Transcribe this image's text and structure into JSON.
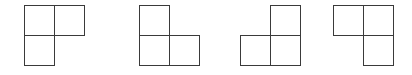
{
  "diagram": {
    "stroke_color": "#3a3a3a",
    "background": "#ffffff",
    "cell_size_px": 30,
    "shapes": [
      {
        "id": "shape-1",
        "missing_cell": "bottom-right",
        "cells": [
          "top-left",
          "top-right",
          "bottom-left"
        ],
        "left": 24
      },
      {
        "id": "shape-2",
        "missing_cell": "top-right",
        "cells": [
          "top-left",
          "bottom-left",
          "bottom-right"
        ],
        "left": 139
      },
      {
        "id": "shape-3",
        "missing_cell": "top-left",
        "cells": [
          "top-right",
          "bottom-left",
          "bottom-right"
        ],
        "left": 240
      },
      {
        "id": "shape-4",
        "missing_cell": "bottom-left",
        "cells": [
          "top-left",
          "top-right",
          "bottom-right"
        ],
        "left": 333
      }
    ]
  }
}
